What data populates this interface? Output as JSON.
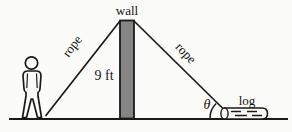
{
  "figure": {
    "type": "geometry-diagram",
    "labels": {
      "wall": "wall",
      "rope_left": "rope",
      "rope_right": "rope",
      "wall_height": "9 ft",
      "angle": "θ",
      "log": "log"
    },
    "colors": {
      "ink": "#1a1a1a",
      "wall_fill": "#858585",
      "paper": "#fbfbf9"
    }
  }
}
